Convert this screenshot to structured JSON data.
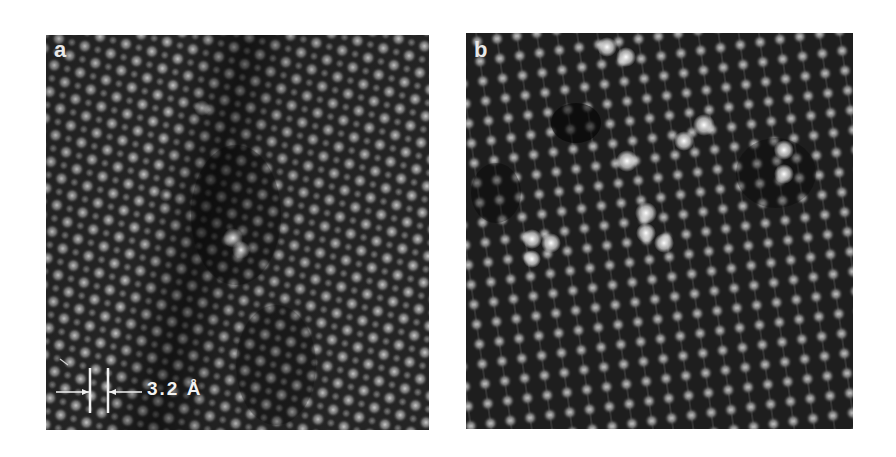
{
  "figure": {
    "panels": [
      {
        "id": "a",
        "label": "a",
        "description": "High-resolution lattice image, diagonal atomic columns with darker band through center",
        "scale_bar": {
          "value": "3.2",
          "unit": "Å",
          "text": "3.2 Å"
        }
      },
      {
        "id": "b",
        "label": "b",
        "description": "High-resolution lattice image, square grid of atomic columns with bright point defects"
      }
    ],
    "colors": {
      "background": "#ffffff",
      "image_dark": "#1a1a1a",
      "image_bright": "#e6e6e6",
      "annotation": "#f2f2f2"
    }
  }
}
